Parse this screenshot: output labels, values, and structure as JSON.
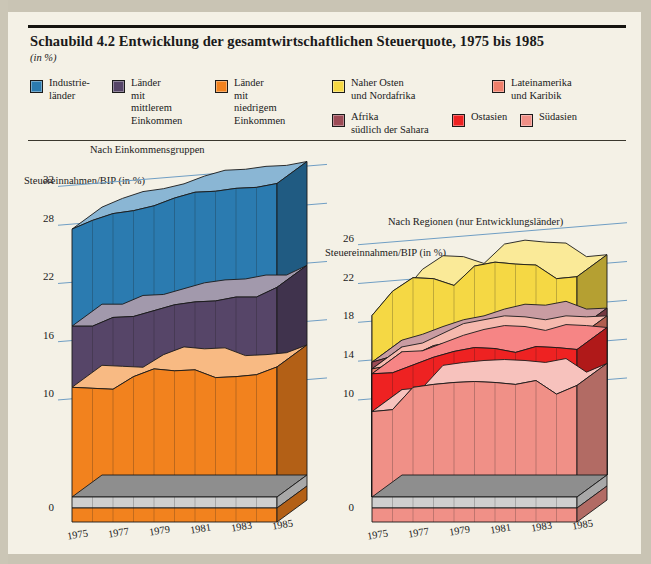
{
  "page": {
    "title": "Schaubild 4.2  Entwicklung der gesamtwirtschaftlichen Steuerquote, 1975 bis 1985",
    "unit_note": "(in %)",
    "background": "#f4f1e6"
  },
  "legend": {
    "left": [
      {
        "label": "Industrie-\nländer",
        "color": "#2B7BB0",
        "name": "legend-industrielaender"
      },
      {
        "label": "Länder\nmit\nmittlerem\nEinkommen",
        "color": "#564568",
        "name": "legend-mittleres-einkommen"
      },
      {
        "label": "Länder\nmit\nniedrigem\nEinkommen",
        "color": "#F2821E",
        "name": "legend-niedriges-einkommen"
      }
    ],
    "right": [
      {
        "label": "Naher Osten\nund Nordafrika",
        "color": "#F5D844",
        "name": "legend-naher-osten"
      },
      {
        "label": "Lateinamerika\nund Karibik",
        "color": "#EF7F6B",
        "name": "legend-lateinamerika"
      },
      {
        "label": "Afrika\nsüdlich der Sahara",
        "color": "#9C4B56",
        "name": "legend-afrika"
      },
      {
        "label": "Ostasien",
        "color": "#EE2222",
        "name": "legend-ostasien"
      },
      {
        "label": "Südasien",
        "color": "#F09087",
        "name": "legend-suedasien"
      }
    ]
  },
  "chart_data": [
    {
      "name": "left",
      "type": "area",
      "title": "Nach Einkommensgruppen",
      "ylabel": "Steuereinnahmen/BIP (in %)",
      "xlabel": "",
      "stacked": true,
      "grid": true,
      "legend_position": "top",
      "ylim": [
        0,
        34
      ],
      "yticks": [
        0,
        10,
        16,
        22,
        28,
        32
      ],
      "x": [
        1975,
        1976,
        1977,
        1978,
        1979,
        1980,
        1981,
        1982,
        1983,
        1984,
        1985
      ],
      "xticks": [
        1975,
        1977,
        1979,
        1981,
        1983,
        1985
      ],
      "series": [
        {
          "name": "Länder mit niedrigem Einkommen",
          "color": "#F2821E",
          "values": [
            11.3,
            11.2,
            11.1,
            12.4,
            13.2,
            13.0,
            13.1,
            12.3,
            12.4,
            12.6,
            13.4
          ]
        },
        {
          "name": "Länder mit mittlerem Einkommen",
          "color": "#564568",
          "values": [
            17.6,
            17.6,
            18.5,
            18.6,
            19.2,
            19.8,
            20.1,
            20.2,
            20.6,
            20.6,
            21.6
          ]
        },
        {
          "name": "Industrieländer",
          "color": "#2B7BB0",
          "values": [
            27.6,
            28.5,
            29.2,
            29.5,
            30.0,
            30.8,
            31.4,
            31.5,
            31.8,
            31.9,
            32.3
          ]
        }
      ]
    },
    {
      "name": "right",
      "type": "area",
      "title": "Nach Regionen (nur Entwicklungsländer)",
      "ylabel": "Steuereinnahmen/BIP (in %)",
      "xlabel": "",
      "stacked": false,
      "grid": true,
      "legend_position": "top",
      "ylim": [
        0,
        27
      ],
      "yticks": [
        0,
        10,
        14,
        18,
        22,
        26
      ],
      "x": [
        1975,
        1976,
        1977,
        1978,
        1979,
        1980,
        1981,
        1982,
        1983,
        1984,
        1985
      ],
      "xticks": [
        1975,
        1977,
        1979,
        1981,
        1983,
        1985
      ],
      "series": [
        {
          "name": "Naher Osten und Nordafrika",
          "color": "#F5D844",
          "values": [
            18.7,
            21.2,
            22.6,
            22.5,
            21.8,
            23.8,
            24.2,
            24.0,
            23.9,
            22.5,
            22.7
          ]
        },
        {
          "name": "Afrika südlich der Sahara",
          "color": "#9C4B56",
          "values": [
            13.9,
            14.5,
            15.3,
            16.0,
            16.4,
            17.1,
            17.6,
            17.5,
            17.9,
            17.1,
            17.2
          ]
        },
        {
          "name": "Lateinamerika und Karibik",
          "color": "#EF7F6B",
          "values": [
            13.2,
            13.6,
            14.6,
            15.6,
            16.0,
            16.4,
            16.3,
            16.0,
            16.4,
            16.3,
            16.4
          ]
        },
        {
          "name": "Ostasien",
          "color": "#EE2222",
          "values": [
            12.7,
            12.8,
            13.6,
            14.4,
            15.0,
            15.4,
            15.3,
            14.9,
            15.5,
            15.4,
            15.2
          ]
        },
        {
          "name": "Südasien",
          "color": "#F09087",
          "values": [
            8.8,
            9.0,
            11.3,
            11.6,
            11.8,
            11.9,
            11.8,
            11.6,
            12.0,
            10.6,
            11.5
          ]
        }
      ]
    }
  ]
}
